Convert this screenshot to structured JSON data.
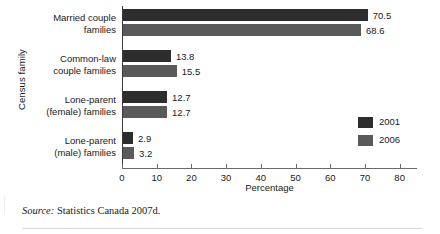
{
  "chart_data": {
    "type": "bar",
    "orientation": "horizontal",
    "title": "",
    "xlabel": "Percentage",
    "ylabel": "Census family",
    "xlim": [
      0,
      85
    ],
    "grid": false,
    "legend_position": "right-inside",
    "categories": [
      "Married couple families",
      "Common-law couple families",
      "Lone-parent (female) families",
      "Lone-parent (male) families"
    ],
    "category_lines": [
      [
        "Married couple",
        "families"
      ],
      [
        "Common-law",
        "couple families"
      ],
      [
        "Lone-parent",
        "(female) families"
      ],
      [
        "Lone-parent",
        "(male) families"
      ]
    ],
    "series": [
      {
        "name": "2001",
        "color": "#2d2d2d",
        "values": [
          70.5,
          13.8,
          12.7,
          2.9
        ]
      },
      {
        "name": "2006",
        "color": "#5a5a5a",
        "values": [
          68.6,
          15.5,
          12.7,
          3.2
        ]
      }
    ],
    "value_labels": [
      [
        "70.5",
        "68.6"
      ],
      [
        "13.8",
        "15.5"
      ],
      [
        "12.7",
        "12.7"
      ],
      [
        "2.9",
        "3.2"
      ]
    ],
    "xticks": [
      0,
      10,
      20,
      30,
      40,
      50,
      60,
      70,
      80
    ],
    "xtick_labels": [
      "0",
      "10",
      "20",
      "30",
      "40",
      "50",
      "60",
      "70",
      "80"
    ]
  },
  "legend": {
    "entries": [
      {
        "label": "2001",
        "color": "#2d2d2d"
      },
      {
        "label": "2006",
        "color": "#5a5a5a"
      }
    ]
  },
  "source": {
    "label": "Source:",
    "text": " Statistics Canada 2007d."
  }
}
